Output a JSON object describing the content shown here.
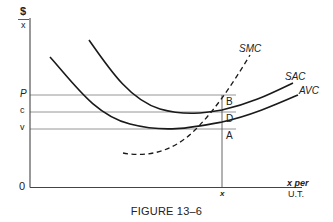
{
  "figure": {
    "caption": "FIGURE 13–6",
    "y_axis": {
      "numerator": "$",
      "denominator": "x"
    },
    "x_axis": {
      "label_line1": "x per",
      "label_line2": "U.T.",
      "origin": "0",
      "tick_label": "x"
    },
    "y_ticks": [
      {
        "label": "P",
        "name": "price"
      },
      {
        "label": "c",
        "name": "average-cost"
      },
      {
        "label": "v",
        "name": "average-variable-cost"
      }
    ],
    "curves": [
      {
        "label": "SMC",
        "name": "short-run-marginal-cost",
        "style": "dashed"
      },
      {
        "label": "SAC",
        "name": "short-run-average-cost",
        "style": "solid"
      },
      {
        "label": "AVC",
        "name": "average-variable-cost",
        "style": "solid"
      }
    ],
    "points": [
      {
        "label": "B"
      },
      {
        "label": "D"
      },
      {
        "label": "A"
      }
    ],
    "colors": {
      "ink": "#222222",
      "grid": "#8a8a8a"
    }
  }
}
